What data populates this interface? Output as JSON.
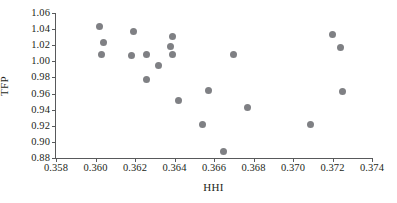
{
  "chart_data": {
    "type": "scatter",
    "title": "",
    "xlabel": "HHI",
    "ylabel": "TFP",
    "xlim": [
      0.358,
      0.374
    ],
    "ylim": [
      0.88,
      1.06
    ],
    "xticks": [
      "0.358",
      "0.360",
      "0.362",
      "0.364",
      "0.366",
      "0.368",
      "0.370",
      "0.372",
      "0.374"
    ],
    "yticks": [
      "0.88",
      "0.90",
      "0.92",
      "0.94",
      "0.96",
      "0.98",
      "1.00",
      "1.02",
      "1.04",
      "1.06"
    ],
    "xtick_values": [
      0.358,
      0.36,
      0.362,
      0.364,
      0.366,
      0.368,
      0.37,
      0.372,
      0.374
    ],
    "ytick_values": [
      0.88,
      0.9,
      0.92,
      0.94,
      0.96,
      0.98,
      1.0,
      1.02,
      1.04,
      1.06
    ],
    "grid": false,
    "legend": false,
    "marker": {
      "shape": "circle",
      "color": "#7f8084",
      "size_px": 7
    },
    "points": [
      {
        "x": 0.3602,
        "y": 1.043
      },
      {
        "x": 0.3604,
        "y": 1.023
      },
      {
        "x": 0.3603,
        "y": 1.009
      },
      {
        "x": 0.3619,
        "y": 1.037
      },
      {
        "x": 0.3618,
        "y": 1.007
      },
      {
        "x": 0.3626,
        "y": 1.009
      },
      {
        "x": 0.3626,
        "y": 0.978
      },
      {
        "x": 0.3632,
        "y": 0.995
      },
      {
        "x": 0.3639,
        "y": 1.031
      },
      {
        "x": 0.3638,
        "y": 1.019
      },
      {
        "x": 0.3639,
        "y": 1.008
      },
      {
        "x": 0.3642,
        "y": 0.951
      },
      {
        "x": 0.3654,
        "y": 0.921
      },
      {
        "x": 0.3657,
        "y": 0.964
      },
      {
        "x": 0.3665,
        "y": 0.888
      },
      {
        "x": 0.367,
        "y": 1.009
      },
      {
        "x": 0.3677,
        "y": 0.943
      },
      {
        "x": 0.3709,
        "y": 0.921
      },
      {
        "x": 0.372,
        "y": 1.033
      },
      {
        "x": 0.3724,
        "y": 1.017
      },
      {
        "x": 0.3725,
        "y": 0.962
      }
    ]
  }
}
